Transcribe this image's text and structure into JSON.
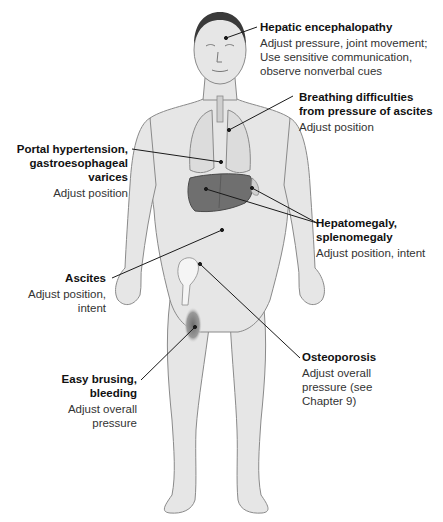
{
  "diagram": {
    "colors": {
      "skin": "#e6e6e6",
      "outline": "#8a8a8a",
      "liver": "#6f6f6f",
      "bruise": "#7a7a7a",
      "leader_line": "#1a1a1a"
    },
    "callouts": [
      {
        "id": "hepatic-encephalopathy",
        "title": "Hepatic encephalopathy",
        "description_lines": [
          "Adjust pressure, joint movement;",
          "Use sensitive communication,",
          "observe nonverbal cues"
        ],
        "side": "right"
      },
      {
        "id": "breathing-difficulties",
        "title_lines": [
          "Breathing difficulties",
          "from pressure of ascites"
        ],
        "description_lines": [
          "Adjust position"
        ],
        "side": "right"
      },
      {
        "id": "portal-hypertension",
        "title_lines": [
          "Portal hypertension,",
          "gastroesophageal",
          "varices"
        ],
        "description_lines": [
          "Adjust position"
        ],
        "side": "left"
      },
      {
        "id": "hepatomegaly",
        "title_lines": [
          "Hepatomegaly,",
          "splenomegaly"
        ],
        "description_lines": [
          "Adjust position, intent"
        ],
        "side": "right"
      },
      {
        "id": "ascites",
        "title_lines": [
          "Ascites"
        ],
        "description_lines": [
          "Adjust position,",
          "intent"
        ],
        "side": "left"
      },
      {
        "id": "osteoporosis",
        "title_lines": [
          "Osteoporosis"
        ],
        "description_lines": [
          "Adjust overall",
          "pressure (see",
          "Chapter 9)"
        ],
        "side": "right"
      },
      {
        "id": "easy-bruising",
        "title_lines": [
          "Easy brusing,",
          "bleeding"
        ],
        "description_lines": [
          "Adjust overall",
          "pressure"
        ],
        "side": "left"
      }
    ]
  }
}
